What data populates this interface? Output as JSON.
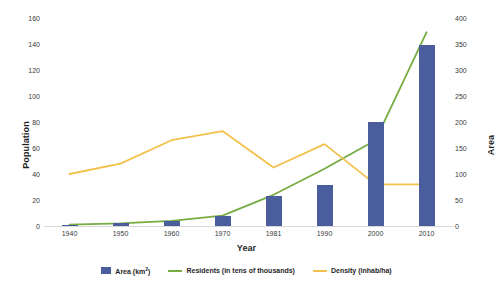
{
  "chart_data": {
    "type": "bar",
    "title": "",
    "categories": [
      "1940",
      "1950",
      "1960",
      "1970",
      "1981",
      "1990",
      "2000",
      "2010"
    ],
    "xlabel": "Year",
    "ylabel": "Population",
    "y2label": "Area",
    "ylim": [
      0,
      160
    ],
    "y2lim": [
      0,
      400
    ],
    "yticks": [
      0,
      20,
      40,
      60,
      80,
      100,
      120,
      140,
      160
    ],
    "y2ticks": [
      0,
      50,
      100,
      150,
      200,
      250,
      300,
      350,
      400
    ],
    "grid": false,
    "legend_position": "bottom",
    "series": [
      {
        "name": "Area (km²)",
        "type": "bar",
        "axis": "right",
        "color": "#4a5e9e",
        "values": [
          2,
          5,
          10,
          20,
          58,
          78,
          200,
          348
        ]
      },
      {
        "name": "Residents (in  tens of thousands)",
        "type": "line",
        "axis": "left",
        "color": "#77ac42",
        "values": [
          1,
          2,
          4,
          8,
          24,
          44,
          66,
          149
        ]
      },
      {
        "name": "Density (inhab/ha)",
        "type": "line",
        "axis": "left",
        "color": "#f2c14b",
        "values": [
          40,
          48,
          66,
          73,
          45,
          63,
          32,
          32
        ]
      }
    ]
  },
  "legend": {
    "items": [
      {
        "label_main": "Area (km",
        "label_sup": "2",
        "label_tail": ")",
        "swatch": "bar",
        "color": "#4a5e9e",
        "name": "legend-item-area"
      },
      {
        "label": "Residents (in  tens of thousands)",
        "swatch": "line",
        "color": "#77ac42",
        "name": "legend-item-residents"
      },
      {
        "label": "Density (inhab/ha)",
        "swatch": "line",
        "color": "#f2c14b",
        "name": "legend-item-density"
      }
    ]
  },
  "colors": {
    "bar": "#4a5e9e",
    "residents_line": "#77ac42",
    "density_line": "#f2c14b",
    "axis": "#d9d9d9",
    "text": "#1f1f1f"
  }
}
